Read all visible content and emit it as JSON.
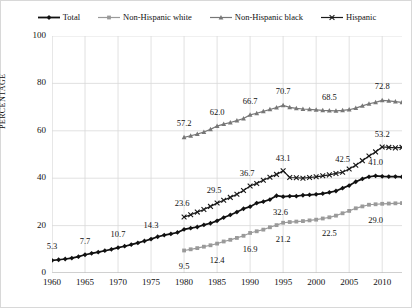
{
  "chart_data": {
    "type": "line",
    "title": "",
    "xlabel": "",
    "ylabel": "PERCENTAGE",
    "xlim": [
      1960,
      2013
    ],
    "ylim": [
      0,
      100
    ],
    "yticks": [
      0,
      20,
      40,
      60,
      80,
      100
    ],
    "xticks": [
      1960,
      1965,
      1970,
      1975,
      1980,
      1985,
      1990,
      1995,
      2000,
      2005,
      2010
    ],
    "grid": true,
    "legend_position": "top",
    "series": [
      {
        "name": "Total",
        "color": "#111111",
        "marker": "diamond",
        "x": [
          1960,
          1961,
          1962,
          1963,
          1964,
          1965,
          1966,
          1967,
          1968,
          1969,
          1970,
          1971,
          1972,
          1973,
          1974,
          1975,
          1976,
          1977,
          1978,
          1979,
          1980,
          1981,
          1982,
          1983,
          1984,
          1985,
          1986,
          1987,
          1988,
          1989,
          1990,
          1991,
          1992,
          1993,
          1994,
          1995,
          1996,
          1997,
          1998,
          1999,
          2000,
          2001,
          2002,
          2003,
          2004,
          2005,
          2006,
          2007,
          2008,
          2009,
          2010,
          2011,
          2012,
          2013
        ],
        "values": [
          5.3,
          5.6,
          5.9,
          6.3,
          6.9,
          7.7,
          8.3,
          8.8,
          9.4,
          10.0,
          10.7,
          11.3,
          12.0,
          12.7,
          13.5,
          14.3,
          15.3,
          16.0,
          16.5,
          17.1,
          18.4,
          18.9,
          19.4,
          20.3,
          21.0,
          22.0,
          23.4,
          24.5,
          25.7,
          27.1,
          28.0,
          29.5,
          30.1,
          31.0,
          32.6,
          32.2,
          32.4,
          32.4,
          32.8,
          33.0,
          33.2,
          33.5,
          34.0,
          34.6,
          35.8,
          36.9,
          38.5,
          39.7,
          40.6,
          41.0,
          40.8,
          40.7,
          40.7,
          40.6
        ]
      },
      {
        "name": "Non-Hispanic white",
        "color": "#9a9a9a",
        "marker": "square",
        "x": [
          1980,
          1981,
          1982,
          1983,
          1984,
          1985,
          1986,
          1987,
          1988,
          1989,
          1990,
          1991,
          1992,
          1993,
          1994,
          1995,
          1996,
          1997,
          1998,
          1999,
          2000,
          2001,
          2002,
          2003,
          2004,
          2005,
          2006,
          2007,
          2008,
          2009,
          2010,
          2011,
          2012,
          2013
        ],
        "values": [
          9.5,
          10.0,
          10.5,
          11.1,
          11.7,
          12.4,
          13.3,
          14.0,
          14.8,
          15.7,
          16.9,
          17.6,
          18.3,
          19.3,
          20.2,
          21.2,
          21.5,
          21.7,
          21.9,
          22.2,
          22.5,
          23.0,
          23.5,
          24.2,
          25.2,
          26.2,
          27.3,
          28.1,
          28.8,
          29.0,
          29.2,
          29.3,
          29.4,
          29.5
        ]
      },
      {
        "name": "Non-Hispanic black",
        "color": "#777777",
        "marker": "triangle",
        "x": [
          1980,
          1981,
          1982,
          1983,
          1984,
          1985,
          1986,
          1987,
          1988,
          1989,
          1990,
          1991,
          1992,
          1993,
          1994,
          1995,
          1996,
          1997,
          1998,
          1999,
          2000,
          2001,
          2002,
          2003,
          2004,
          2005,
          2006,
          2007,
          2008,
          2009,
          2010,
          2011,
          2012,
          2013
        ],
        "values": [
          57.2,
          57.9,
          58.6,
          59.5,
          60.6,
          62.0,
          62.8,
          63.5,
          64.3,
          65.2,
          66.7,
          67.4,
          68.2,
          69.0,
          69.8,
          70.7,
          69.9,
          69.5,
          69.2,
          69.0,
          68.8,
          68.6,
          68.5,
          68.4,
          68.6,
          68.9,
          69.6,
          70.5,
          71.4,
          72.0,
          72.8,
          72.6,
          72.3,
          72.0
        ]
      },
      {
        "name": "Hispanic",
        "color": "#1a1a1a",
        "marker": "x",
        "x": [
          1980,
          1981,
          1982,
          1983,
          1984,
          1985,
          1986,
          1987,
          1988,
          1989,
          1990,
          1991,
          1992,
          1993,
          1994,
          1995,
          1996,
          1997,
          1998,
          1999,
          2000,
          2001,
          2002,
          2003,
          2004,
          2005,
          2006,
          2007,
          2008,
          2009,
          2010,
          2011,
          2012,
          2013
        ],
        "values": [
          23.6,
          24.6,
          25.7,
          26.8,
          28.1,
          29.5,
          30.7,
          31.9,
          33.2,
          34.8,
          36.7,
          37.8,
          39.1,
          40.4,
          41.6,
          43.1,
          40.3,
          40.2,
          40.0,
          40.3,
          40.6,
          41.0,
          41.4,
          42.0,
          42.5,
          43.9,
          45.5,
          47.4,
          49.4,
          51.1,
          53.2,
          53.0,
          52.8,
          53.0
        ]
      }
    ],
    "point_labels": [
      {
        "series": "Total",
        "year": 1960,
        "value": 5.3,
        "text": "5.3",
        "dx": 0,
        "dy": -14
      },
      {
        "series": "Total",
        "year": 1965,
        "value": 7.7,
        "text": "7.7",
        "dx": 0,
        "dy": -14
      },
      {
        "series": "Total",
        "year": 1970,
        "value": 10.7,
        "text": "10.7",
        "dx": 0,
        "dy": -14
      },
      {
        "series": "Total",
        "year": 1975,
        "value": 14.3,
        "text": "14.3",
        "dx": 0,
        "dy": -14
      },
      {
        "series": "Total",
        "year": 1994,
        "value": 32.6,
        "text": "32.6",
        "dx": 4,
        "dy": 16
      },
      {
        "series": "Total",
        "year": 2009,
        "value": 41.0,
        "text": "41.0",
        "dx": 0,
        "dy": -14
      },
      {
        "series": "Non-Hispanic white",
        "year": 1980,
        "value": 9.5,
        "text": "9.5",
        "dx": 0,
        "dy": 16
      },
      {
        "series": "Non-Hispanic white",
        "year": 1985,
        "value": 12.4,
        "text": "12.4",
        "dx": 0,
        "dy": 16
      },
      {
        "series": "Non-Hispanic white",
        "year": 1990,
        "value": 16.9,
        "text": "16.9",
        "dx": 0,
        "dy": 16
      },
      {
        "series": "Non-Hispanic white",
        "year": 1995,
        "value": 21.2,
        "text": "21.2",
        "dx": 0,
        "dy": 16
      },
      {
        "series": "Non-Hispanic white",
        "year": 2002,
        "value": 23.5,
        "text": "22.5",
        "dx": 0,
        "dy": 16
      },
      {
        "series": "Non-Hispanic white",
        "year": 2009,
        "value": 29.0,
        "text": "29.0",
        "dx": 0,
        "dy": 16
      },
      {
        "series": "Non-Hispanic black",
        "year": 1980,
        "value": 57.2,
        "text": "57.2",
        "dx": 0,
        "dy": -14
      },
      {
        "series": "Non-Hispanic black",
        "year": 1985,
        "value": 62.0,
        "text": "62.0",
        "dx": 0,
        "dy": -14
      },
      {
        "series": "Non-Hispanic black",
        "year": 1990,
        "value": 66.7,
        "text": "66.7",
        "dx": 0,
        "dy": -14
      },
      {
        "series": "Non-Hispanic black",
        "year": 1995,
        "value": 70.7,
        "text": "70.7",
        "dx": 0,
        "dy": -14
      },
      {
        "series": "Non-Hispanic black",
        "year": 2002,
        "value": 68.5,
        "text": "68.5",
        "dx": 0,
        "dy": -14
      },
      {
        "series": "Non-Hispanic black",
        "year": 2010,
        "value": 72.8,
        "text": "72.8",
        "dx": 0,
        "dy": -14
      },
      {
        "series": "Hispanic",
        "year": 1980,
        "value": 23.6,
        "text": "23.6",
        "dx": -2,
        "dy": -14
      },
      {
        "series": "Hispanic",
        "year": 1985,
        "value": 29.5,
        "text": "29.5",
        "dx": -3,
        "dy": -13
      },
      {
        "series": "Hispanic",
        "year": 1990,
        "value": 36.7,
        "text": "36.7",
        "dx": -3,
        "dy": -13
      },
      {
        "series": "Hispanic",
        "year": 1995,
        "value": 43.1,
        "text": "43.1",
        "dx": 0,
        "dy": -13
      },
      {
        "series": "Hispanic",
        "year": 2004,
        "value": 42.5,
        "text": "42.5",
        "dx": 0,
        "dy": -13
      },
      {
        "series": "Hispanic",
        "year": 2010,
        "value": 53.2,
        "text": "53.2",
        "dx": 0,
        "dy": -13
      }
    ]
  },
  "legend": {
    "items": [
      {
        "label": "Total"
      },
      {
        "label": "Non-Hispanic white"
      },
      {
        "label": "Non-Hispanic black"
      },
      {
        "label": "Hispanic"
      }
    ]
  }
}
